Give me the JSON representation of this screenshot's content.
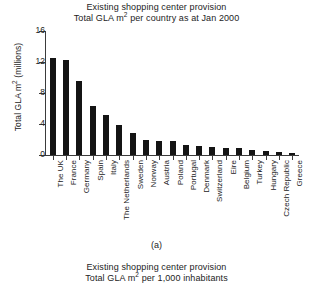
{
  "top_title": {
    "line1": "Existing shopping center provision",
    "line2_pre": "Total GLA m",
    "line2_sup": "2",
    "line2_post": " per country as at Jan 2000"
  },
  "caption": "(a)",
  "bottom_title": {
    "line1": "Existing shopping center provision",
    "line2_pre": "Total GLA m",
    "line2_sup": "2",
    "line2_post": " per 1,000 inhabitants"
  },
  "chart_data": {
    "type": "bar",
    "xlabel": "",
    "ylabel_pre": "Total GLA m",
    "ylabel_sup": "2",
    "ylabel_post": " (millions)",
    "ylabel": "Total GLA m2 (millions)",
    "ylim": [
      0,
      16
    ],
    "yticks": [
      0,
      4,
      8,
      12,
      16
    ],
    "ytick_labels": [
      "0",
      "4",
      "8",
      "12",
      "16"
    ],
    "grid": false,
    "legend": false,
    "bar_color": "#141414",
    "categories": [
      "The UK",
      "France",
      "Germany",
      "Spain",
      "Italy",
      "The Netherlands",
      "Sweden",
      "Norway",
      "Austria",
      "Poland",
      "Portugal",
      "Denmark",
      "Switzerland",
      "Eire",
      "Belgium",
      "Turkey",
      "Hungary",
      "Czech Republic",
      "Greece"
    ],
    "values": [
      12.5,
      12.2,
      9.5,
      6.3,
      5.1,
      3.9,
      2.8,
      1.9,
      1.85,
      1.75,
      1.3,
      1.1,
      1.05,
      0.95,
      0.85,
      0.6,
      0.5,
      0.35,
      0.25
    ]
  }
}
